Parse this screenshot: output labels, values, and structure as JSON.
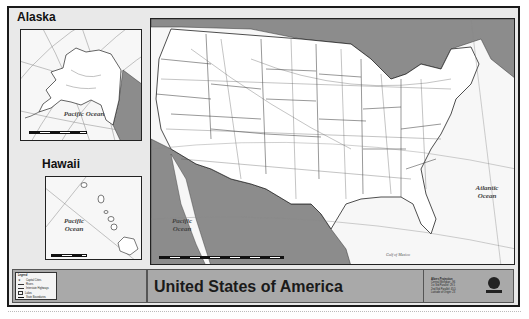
{
  "map": {
    "title": "United States of America",
    "insets": {
      "alaska": {
        "title": "Alaska",
        "ocean_label": "Pacific Ocean",
        "scale_ticks": [
          "0",
          "100",
          "200",
          "400",
          "600",
          "800"
        ]
      },
      "hawaii": {
        "title": "Hawaii",
        "ocean_label": "Pacific Ocean",
        "scale_ticks": [
          "0",
          "25",
          "50",
          "100",
          "150"
        ]
      }
    },
    "main": {
      "pacific_label": "Pacific Ocean",
      "atlantic_label": "Atlantic Ocean",
      "gulf_label": "Gulf of Mexico",
      "scale_ticks": [
        "0",
        "125",
        "250",
        "500",
        "750",
        "1,000"
      ],
      "longitude_ticks": [
        "-125°",
        "-115°",
        "-105°",
        "-95°",
        "-85°",
        "-75°",
        "-65°"
      ]
    },
    "legend": {
      "title": "Legend",
      "items": [
        {
          "symbol": "star",
          "label": "Capital Cities"
        },
        {
          "symbol": "line-thin",
          "label": "Rivers"
        },
        {
          "symbol": "line-double",
          "label": "Interstate Highways"
        },
        {
          "symbol": "box",
          "label": "Lakes"
        },
        {
          "symbol": "line-thick",
          "label": "State Boundaries"
        }
      ]
    },
    "projection": {
      "lines": [
        "Albers Projection",
        "Central Meridian: -96",
        "1st Std Parallel: 29.5",
        "2nd Std Parallel: 45.5",
        "Latitude of Origin: 23"
      ]
    },
    "colors": {
      "sheet": "#e9e9e9",
      "land": "#ffffff",
      "foreign": "#8c8c8c",
      "titlebar": "#a9a9a9",
      "border": "#1a1a1a"
    }
  }
}
